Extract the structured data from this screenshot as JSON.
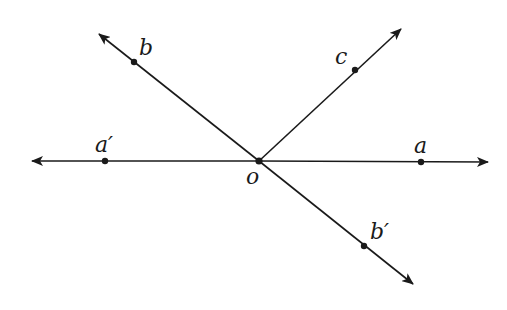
{
  "diagram": {
    "stroke_color": "#1a1a1a",
    "background": "#ffffff",
    "origin": {
      "label": "o",
      "x": 259,
      "y": 161
    },
    "lines": [
      {
        "id": "line-aa",
        "from": [
          30,
          161
        ],
        "to": [
          490,
          162
        ],
        "arrows": "both"
      },
      {
        "id": "line-bb",
        "from": [
          97,
          32
        ],
        "to": [
          415,
          286
        ],
        "arrows": "both"
      },
      {
        "id": "ray-c",
        "from": [
          259,
          161
        ],
        "to": [
          403,
          27
        ],
        "arrows": "end"
      }
    ],
    "points": [
      {
        "label": "a",
        "x": 421,
        "y": 162
      },
      {
        "label": "a′",
        "x": 105,
        "y": 161
      },
      {
        "label": "b",
        "x": 134,
        "y": 62
      },
      {
        "label": "b′",
        "x": 364,
        "y": 246
      },
      {
        "label": "c",
        "x": 355,
        "y": 70
      },
      {
        "label": "o",
        "x": 259,
        "y": 161
      }
    ],
    "labels": {
      "a": "a",
      "a_prime": "a′",
      "b": "b",
      "b_prime": "b′",
      "c": "c",
      "o": "o"
    }
  }
}
